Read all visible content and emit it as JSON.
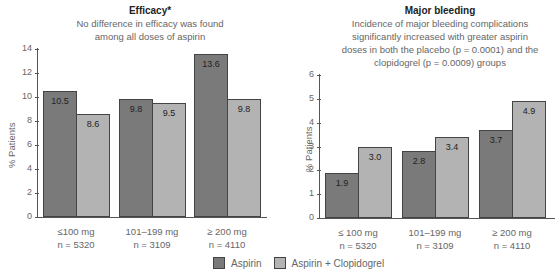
{
  "chart_data": [
    {
      "type": "bar",
      "title": "Efficacy*",
      "subtitle": "No difference in efficacy was found among all doses of aspirin",
      "ylabel": "% Patients",
      "ylim": [
        0,
        14
      ],
      "yticks": [
        0,
        2,
        4,
        6,
        8,
        10,
        12,
        14
      ],
      "categories": [
        "≤100 mg\nn = 5320",
        "101–199 mg\nn = 3109",
        "≥ 200 mg\nn = 4110"
      ],
      "series": [
        {
          "name": "Aspirin",
          "values": [
            10.5,
            9.8,
            13.6
          ]
        },
        {
          "name": "Aspirin + Clopidogrel",
          "values": [
            8.6,
            9.5,
            9.8
          ]
        }
      ]
    },
    {
      "type": "bar",
      "title": "Major bleeding",
      "subtitle": "Incidence of major bleeding complications significantly increased with greater aspirin doses in both the placebo (p = 0.0001) and the clopidogrel (p = 0.0009) groups",
      "ylabel": "% Patients",
      "ylim": [
        0,
        6
      ],
      "yticks": [
        0,
        1,
        2,
        3,
        4,
        5,
        6
      ],
      "categories": [
        "≤ 100 mg\nn = 5320",
        "101–199 mg\nn = 3109",
        "≥ 200 mg\nn = 4110"
      ],
      "series": [
        {
          "name": "Aspirin",
          "values": [
            1.9,
            2.8,
            3.7
          ]
        },
        {
          "name": "Aspirin + Clopidogrel",
          "values": [
            3.0,
            3.4,
            4.9
          ]
        }
      ]
    }
  ],
  "left": {
    "title": "Efficacy*",
    "sub1": "No difference in efficacy was found",
    "sub2": "among all doses of aspirin",
    "ylabel": "% Patients",
    "cats": [
      {
        "l1": "≤100 mg",
        "l2": "n = 5320"
      },
      {
        "l1": "101–199 mg",
        "l2": "n = 3109"
      },
      {
        "l1": "≥ 200 mg",
        "l2": "n = 4110"
      }
    ],
    "labels_a": [
      "10.5",
      "9.8",
      "13.6"
    ],
    "labels_c": [
      "8.6",
      "9.5",
      "9.8"
    ],
    "ticks": [
      "0",
      "2",
      "4",
      "6",
      "8",
      "10",
      "12",
      "14"
    ]
  },
  "right": {
    "title": "Major bleeding",
    "sub1": "Incidence of major bleeding complications",
    "sub2": "significantly increased with greater aspirin",
    "sub3": "doses in both the placebo (p = 0.0001) and the",
    "sub4": "clopidogrel (p = 0.0009) groups",
    "ylabel": "% Patients",
    "cats": [
      {
        "l1": "≤ 100 mg",
        "l2": "n = 5320"
      },
      {
        "l1": "101–199 mg",
        "l2": "n = 3109"
      },
      {
        "l1": "≥ 200 mg",
        "l2": "n = 4110"
      }
    ],
    "labels_a": [
      "1.9",
      "2.8",
      "3.7"
    ],
    "labels_c": [
      "3.0",
      "3.4",
      "4.9"
    ],
    "ticks": [
      "0",
      "1",
      "2",
      "3",
      "4",
      "5",
      "6"
    ]
  },
  "legend": {
    "aspirin": "Aspirin",
    "combo": "Aspirin + Clopidogrel",
    "color_a": "#7a7a7a",
    "color_c": "#b3b3b3"
  }
}
